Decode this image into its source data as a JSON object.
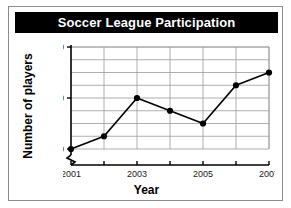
{
  "chart_data": {
    "type": "line",
    "title": "Soccer League Participation",
    "xlabel": "Year",
    "ylabel": "Number of players",
    "x": [
      2001,
      2002,
      2003,
      2004,
      2005,
      2006,
      2007
    ],
    "categories": [
      "2001",
      "2002",
      "2003",
      "2004",
      "2005",
      "2006",
      "2007"
    ],
    "values": [
      200,
      225,
      300,
      275,
      250,
      325,
      350
    ],
    "series": [
      {
        "name": "Number of players",
        "values": [
          200,
          225,
          300,
          275,
          250,
          325,
          350
        ]
      }
    ],
    "xlim": [
      2001,
      2007
    ],
    "ylim": [
      200,
      400
    ],
    "ytick_labels": [
      "200",
      "300",
      "400"
    ],
    "ytick_values": [
      200,
      300,
      400
    ],
    "xtick_labels": [
      "2001",
      "2003",
      "2005",
      "2007"
    ],
    "xtick_values": [
      2001,
      2003,
      2005,
      2007
    ],
    "xtick_all": [
      2001,
      2002,
      2003,
      2004,
      2005,
      2006,
      2007
    ],
    "gridlines": {
      "horizontal": [
        200,
        225,
        250,
        275,
        300,
        325,
        350,
        375,
        400
      ],
      "vertical": [
        2001,
        2002,
        2003,
        2004,
        2005,
        2006,
        2007
      ],
      "visible": true
    },
    "axis_break": true,
    "legend": null,
    "colors": {
      "title_background": "#000000",
      "title_text": "#ffffff",
      "line": "#000000",
      "marker": "#000000",
      "grid": "#9a9a9a",
      "axis": "#000000",
      "plot_background": "#ffffff",
      "frame_border": "#8b8b8b"
    }
  }
}
